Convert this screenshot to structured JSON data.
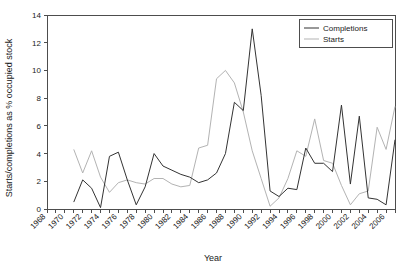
{
  "chart_data": {
    "type": "line",
    "title": "",
    "xlabel": "Year",
    "ylabel": "Starts/completions as % occupied stock",
    "xlim": [
      1968,
      2007
    ],
    "ylim": [
      0,
      14
    ],
    "ytick_step": 2,
    "xtick_step": 2,
    "grid": false,
    "legend_position": "top-right",
    "yticks": [
      "0",
      "2",
      "4",
      "6",
      "8",
      "10",
      "12",
      "14"
    ],
    "xticks": [
      "1968",
      "1970",
      "1972",
      "1974",
      "1976",
      "1978",
      "1980",
      "1982",
      "1984",
      "1986",
      "1988",
      "1990",
      "1992",
      "1994",
      "1996",
      "1998",
      "2000",
      "2002",
      "2004",
      "2006"
    ],
    "colors": {
      "completions": "#333333",
      "starts": "#b3b3b3",
      "axis": "#4d4d4d"
    },
    "series": [
      {
        "name": "Completions",
        "color": "#333333",
        "x": [
          1971,
          1972,
          1973,
          1974,
          1975,
          1976,
          1977,
          1978,
          1979,
          1980,
          1981,
          1982,
          1983,
          1984,
          1985,
          1986,
          1987,
          1988,
          1989,
          1990,
          1991,
          1992,
          1993,
          1994,
          1995,
          1996,
          1997,
          1998,
          1999,
          2000,
          2001,
          2002,
          2003,
          2004,
          2005,
          2006,
          2007
        ],
        "values": [
          0.5,
          2.1,
          1.5,
          0.1,
          3.8,
          4.1,
          2.1,
          0.3,
          1.6,
          4.0,
          3.1,
          2.8,
          2.5,
          2.3,
          1.9,
          2.1,
          2.6,
          4.0,
          7.7,
          7.1,
          13.0,
          8.2,
          1.3,
          0.9,
          1.5,
          1.4,
          4.4,
          3.3,
          3.3,
          2.7,
          7.5,
          1.8,
          6.7,
          0.8,
          0.7,
          0.3,
          5.0
        ]
      },
      {
        "name": "Starts",
        "color": "#b3b3b3",
        "x": [
          1971,
          1972,
          1973,
          1974,
          1975,
          1976,
          1977,
          1978,
          1979,
          1980,
          1981,
          1982,
          1983,
          1984,
          1985,
          1986,
          1987,
          1988,
          1989,
          1990,
          1991,
          1992,
          1993,
          1994,
          1995,
          1996,
          1997,
          1998,
          1999,
          2000,
          2001,
          2002,
          2003,
          2004,
          2005,
          2006,
          2007
        ],
        "values": [
          4.3,
          2.6,
          4.2,
          2.3,
          1.2,
          1.9,
          2.1,
          1.9,
          1.8,
          2.2,
          2.2,
          1.8,
          1.6,
          1.7,
          4.4,
          4.6,
          9.4,
          10.0,
          9.1,
          7.0,
          4.2,
          2.2,
          0.2,
          0.8,
          2.2,
          4.2,
          3.8,
          6.5,
          3.5,
          3.3,
          1.7,
          0.3,
          1.1,
          1.3,
          5.9,
          4.3,
          7.4
        ]
      }
    ],
    "legend": [
      {
        "label": "Completions",
        "color": "#333333"
      },
      {
        "label": "Starts",
        "color": "#b3b3b3"
      }
    ]
  }
}
